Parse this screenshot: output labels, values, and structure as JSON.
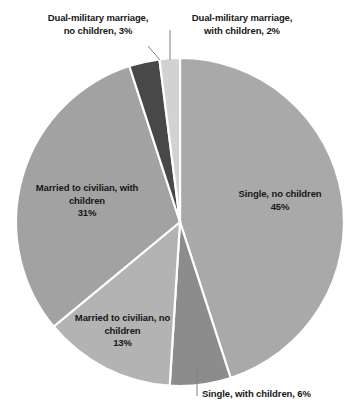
{
  "chart_data": {
    "type": "pie",
    "title": "",
    "subtitle": "",
    "xlabel": "",
    "ylabel": "",
    "legend_position": "none",
    "grid": false,
    "total": 100,
    "units": "percent",
    "start_angle_deg": 0,
    "direction": "clockwise",
    "categories": [
      "Single, no children",
      "Single, with children",
      "Married to civilian, no children",
      "Married to civilian, with children",
      "Dual-military marriage, no children",
      "Dual-military marriage, with children"
    ],
    "values": [
      45,
      6,
      13,
      31,
      3,
      2
    ],
    "slices": [
      {
        "key": "single-no-children",
        "category": "Single, no children",
        "value": 45,
        "value_label": "45%",
        "color": "#a9a9a9",
        "label_lines": [
          "Single, no children",
          "45%"
        ],
        "label_placement": "inside"
      },
      {
        "key": "single-with-children",
        "category": "Single, with children",
        "value": 6,
        "value_label": "6%",
        "color": "#8c8c8c",
        "label_lines": [
          "Single, with children, 6%"
        ],
        "label_placement": "outside"
      },
      {
        "key": "married-civilian-no-children",
        "category": "Married to civilian, no children",
        "value": 13,
        "value_label": "13%",
        "color": "#b3b3b3",
        "label_lines": [
          "Married to civilian, no",
          "children",
          "13%"
        ],
        "label_placement": "inside"
      },
      {
        "key": "married-civilian-with-children",
        "category": "Married to civilian, with children",
        "value": 31,
        "value_label": "31%",
        "color": "#a2a2a2",
        "label_lines": [
          "Married to civilian, with",
          "children",
          "31%"
        ],
        "label_placement": "inside"
      },
      {
        "key": "dual-military-no-children",
        "category": "Dual-military marriage, no children",
        "value": 3,
        "value_label": "3%",
        "color": "#484848",
        "label_lines": [
          "Dual-military marriage,",
          "no children, 3%"
        ],
        "label_placement": "outside"
      },
      {
        "key": "dual-military-with-children",
        "category": "Dual-military marriage, with children",
        "value": 2,
        "value_label": "2%",
        "color": "#d2d2d2",
        "label_lines": [
          "Dual-military marriage,",
          "with children, 2%"
        ],
        "label_placement": "outside"
      }
    ],
    "geometry": {
      "center_x": 180,
      "center_y": 222,
      "radius": 164
    },
    "style": {
      "background": "#ffffff",
      "slice_border": "#ffffff",
      "leader_line": "#808080",
      "label_text": "#171717"
    }
  },
  "labels": {
    "dual_no_children": "Dual-military marriage,\nno children, 3%",
    "dual_with_children": "Dual-military marriage,\nwith children, 2%",
    "single_no_children": "Single, no children\n45%",
    "married_with_children": "Married to civilian, with\nchildren\n31%",
    "married_no_children": "Married to civilian, no\nchildren\n13%",
    "single_with_children": "Single, with children, 6%"
  }
}
